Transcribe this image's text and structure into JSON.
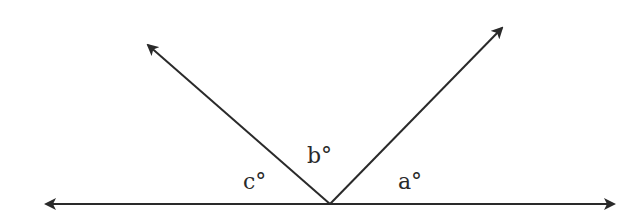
{
  "diagram": {
    "type": "angles-on-a-straight-line",
    "line_color": "#2a2a2a",
    "background": "#ffffff",
    "vertex": {
      "x": 330,
      "y": 204
    },
    "baseline": {
      "left_arrow": {
        "x": 44,
        "y": 204
      },
      "right_arrow": {
        "x": 616,
        "y": 204
      }
    },
    "rays": [
      {
        "name": "left-ray",
        "tip": {
          "x": 146,
          "y": 43
        }
      },
      {
        "name": "right-ray",
        "tip": {
          "x": 504,
          "y": 26
        }
      }
    ],
    "labels": {
      "a": "a°",
      "b": "b°",
      "c": "c°"
    }
  }
}
